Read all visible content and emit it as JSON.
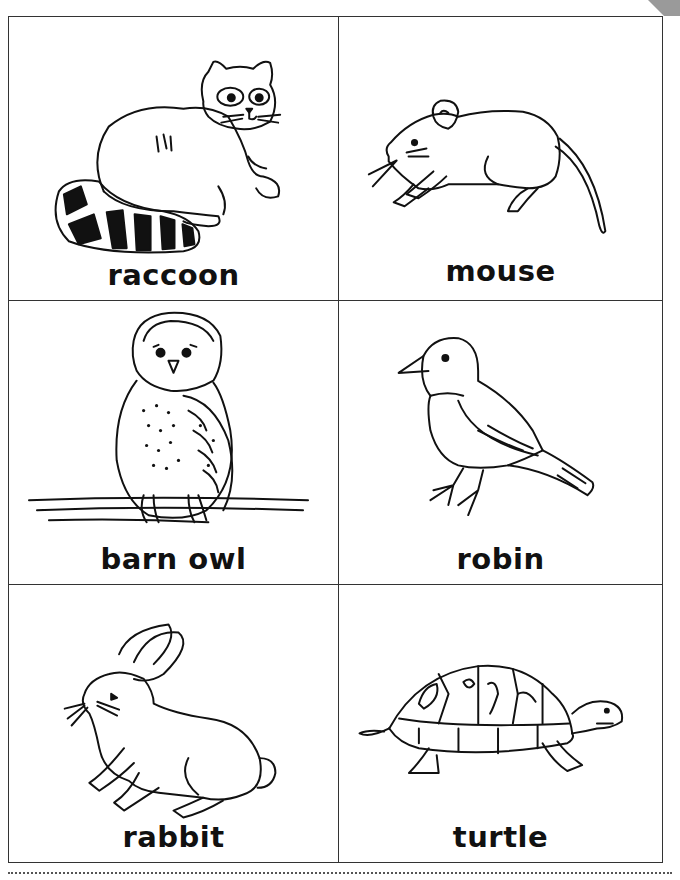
{
  "page": {
    "header_text": "Animals of the Night",
    "cut_line": "dotted cut line"
  },
  "cards": [
    {
      "label": "raccoon",
      "icon": "raccoon-illustration"
    },
    {
      "label": "mouse",
      "icon": "mouse-illustration"
    },
    {
      "label": "barn owl",
      "icon": "barn-owl-illustration"
    },
    {
      "label": "robin",
      "icon": "robin-illustration"
    },
    {
      "label": "rabbit",
      "icon": "rabbit-illustration"
    },
    {
      "label": "turtle",
      "icon": "turtle-illustration"
    }
  ],
  "colors": {
    "line": "#111111",
    "border": "#333333",
    "background": "#ffffff"
  }
}
